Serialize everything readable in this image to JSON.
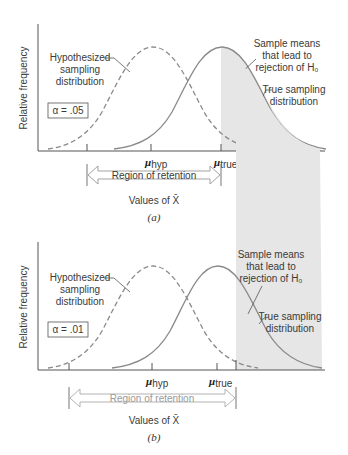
{
  "panels": [
    {
      "id": "a",
      "caption": "(a)",
      "alpha_label": "α = .05",
      "y_axis_label": "Relative frequency",
      "x_axis_label": "Values of X̄",
      "hyp_label_lines": [
        "Hypothesized",
        "sampling",
        "distribution"
      ],
      "true_label_lines": [
        "True sampling",
        "distribution"
      ],
      "reject_label_lines": [
        "Sample means",
        "that lead to",
        "rejection of H₀"
      ],
      "mu_hyp": "μ",
      "mu_hyp_sub": "hyp",
      "mu_true": "μ",
      "mu_true_sub": "true",
      "region_label": "Region of retention"
    },
    {
      "id": "b",
      "caption": "(b)",
      "alpha_label": "α = .01",
      "y_axis_label": "Relative frequency",
      "x_axis_label": "Values of X̄",
      "hyp_label_lines": [
        "Hypothesized",
        "sampling",
        "distribution"
      ],
      "true_label_lines": [
        "True sampling",
        "distribution"
      ],
      "reject_label_lines": [
        "Sample means",
        "that lead to",
        "rejection of H₀"
      ],
      "mu_hyp": "μ",
      "mu_hyp_sub": "hyp",
      "mu_true": "μ",
      "mu_true_sub": "true",
      "region_label": "Region of retention"
    }
  ],
  "colors": {
    "curve": "#8a8a8a",
    "shading": "#e6e6e6",
    "axis": "#555555",
    "text": "#3a3a3a",
    "region_text_b": "#9a9a9a"
  }
}
